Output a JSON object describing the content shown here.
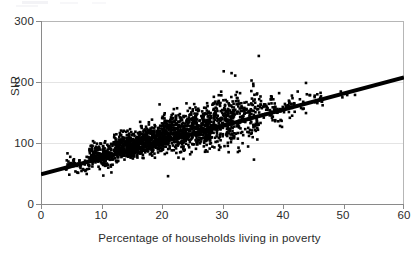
{
  "chart_data": {
    "type": "scatter",
    "title": "",
    "xlabel": "Percentage of households living in poverty",
    "ylabel": "SIR",
    "xlim": [
      0,
      60
    ],
    "ylim": [
      0,
      300
    ],
    "xticks": [
      0,
      10,
      20,
      30,
      40,
      50,
      60
    ],
    "yticks": [
      0,
      100,
      200,
      300
    ],
    "xtick_labels": [
      "0",
      "10",
      "20",
      "30",
      "40",
      "50",
      "60"
    ],
    "ytick_labels": [
      "0",
      "100",
      "200",
      "300"
    ],
    "grid": "faint horizontal gridlines at SIR 100 and 200",
    "legend": "none",
    "marker": {
      "shape": "square",
      "color": "#000000",
      "size_px": 2.6,
      "count_approx": 2000
    },
    "n_points": 2000,
    "point_cloud_description": "Dense black square markers forming an elongated cloud rising from lower-left to upper-right; heaviest density between 12% and 30% poverty at SIR 80-140; spread widens markedly above 28% poverty.",
    "x_range_observed": [
      4.0,
      51.0
    ],
    "y_range_observed": [
      42,
      243
    ],
    "correlation_approx": 0.72,
    "notable_outliers": [
      {
        "x": 36.0,
        "y": 243
      },
      {
        "x": 30.2,
        "y": 218
      },
      {
        "x": 31.5,
        "y": 215
      },
      {
        "x": 32.1,
        "y": 211
      },
      {
        "x": 34.8,
        "y": 203
      },
      {
        "x": 43.8,
        "y": 199
      },
      {
        "x": 19.6,
        "y": 164
      },
      {
        "x": 21.0,
        "y": 47
      },
      {
        "x": 10.3,
        "y": 48
      },
      {
        "x": 35.2,
        "y": 74
      }
    ],
    "regression_line": {
      "type": "linear-fit",
      "color": "#000000",
      "width_px": 4.2,
      "x_start": 0,
      "y_start": 50,
      "x_end": 60,
      "y_end": 208,
      "slope": 2.633,
      "intercept": 50
    },
    "series": [
      {
        "name": "Electoral wards",
        "marker_color": "#000000",
        "points_summary_bins": [
          {
            "x_bin": "4-8",
            "y_mean": 66,
            "y_min": 45,
            "y_max": 95,
            "count": 60
          },
          {
            "x_bin": "8-12",
            "y_mean": 82,
            "y_min": 47,
            "y_max": 122,
            "count": 200
          },
          {
            "x_bin": "12-16",
            "y_mean": 95,
            "y_min": 55,
            "y_max": 135,
            "count": 320
          },
          {
            "x_bin": "16-20",
            "y_mean": 106,
            "y_min": 58,
            "y_max": 150,
            "count": 350
          },
          {
            "x_bin": "20-24",
            "y_mean": 117,
            "y_min": 47,
            "y_max": 160,
            "count": 330
          },
          {
            "x_bin": "24-28",
            "y_mean": 127,
            "y_min": 55,
            "y_max": 178,
            "count": 280
          },
          {
            "x_bin": "28-32",
            "y_mean": 137,
            "y_min": 62,
            "y_max": 218,
            "count": 220
          },
          {
            "x_bin": "32-36",
            "y_mean": 146,
            "y_min": 70,
            "y_max": 243,
            "count": 140
          },
          {
            "x_bin": "36-40",
            "y_mean": 155,
            "y_min": 95,
            "y_max": 196,
            "count": 60
          },
          {
            "x_bin": "40-44",
            "y_mean": 163,
            "y_min": 108,
            "y_max": 199,
            "count": 30
          },
          {
            "x_bin": "44-48",
            "y_mean": 172,
            "y_min": 140,
            "y_max": 194,
            "count": 14
          },
          {
            "x_bin": "48-52",
            "y_mean": 181,
            "y_min": 168,
            "y_max": 192,
            "count": 5
          }
        ]
      }
    ]
  },
  "axes": {
    "y_title": "SIR",
    "x_title": "Percentage of households living in poverty"
  }
}
